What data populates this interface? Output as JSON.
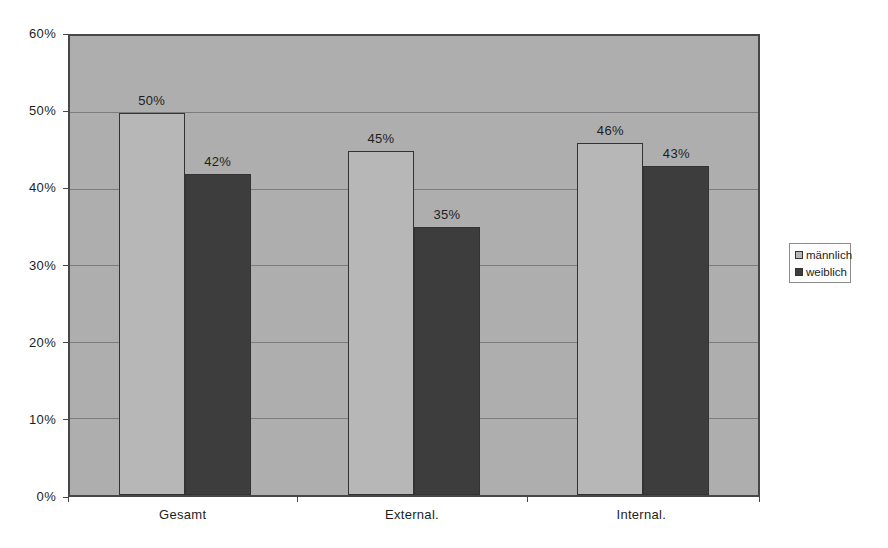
{
  "chart_data": {
    "type": "bar",
    "title": "",
    "xlabel": "",
    "ylabel": "",
    "categories": [
      "Gesamt",
      "External.",
      "Internal."
    ],
    "series": [
      {
        "name": "männlich",
        "values": [
          50,
          45,
          46
        ],
        "labels": [
          "50%",
          "45%",
          "46%"
        ],
        "color": "#b7b7b7"
      },
      {
        "name": "weiblich",
        "values": [
          42,
          35,
          43
        ],
        "labels": [
          "42%",
          "35%",
          "43%"
        ],
        "color": "#3d3d3d"
      }
    ],
    "ylim": [
      0,
      60
    ],
    "yticks": [
      {
        "value": 0,
        "label": "0%"
      },
      {
        "value": 10,
        "label": "10%"
      },
      {
        "value": 20,
        "label": "20%"
      },
      {
        "value": 30,
        "label": "30%"
      },
      {
        "value": 40,
        "label": "40%"
      },
      {
        "value": 50,
        "label": "50%"
      },
      {
        "value": 60,
        "label": "60%"
      }
    ],
    "grid": true,
    "legend_position": "right"
  },
  "colors": {
    "page_background": "#ffffff",
    "plot_background": "#aeaeae",
    "plot_border": "#474747",
    "gridline": "#7c7c7c",
    "bar_border": "#333333",
    "text": "#1e1e1e",
    "legend_background": "#fdfdfd",
    "legend_border": "#8c8c8c"
  }
}
